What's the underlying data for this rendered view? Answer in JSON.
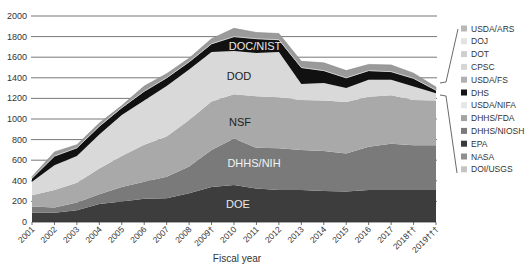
{
  "chart_data": {
    "type": "area",
    "stacked": true,
    "title": "",
    "xlabel": "Fiscal year",
    "ylabel": "",
    "ylim": [
      0,
      2000
    ],
    "yticks": [
      0,
      200,
      400,
      600,
      800,
      1000,
      1200,
      1400,
      1600,
      1800,
      2000
    ],
    "grid": true,
    "legend_position": "right",
    "categories": [
      "2001",
      "2002",
      "2003",
      "2004",
      "2005",
      "2006",
      "2007",
      "2008",
      "2009†",
      "2010",
      "2011",
      "2012",
      "2013",
      "2014",
      "2015",
      "2016",
      "2017",
      "2018††",
      "2019†††"
    ],
    "series": [
      {
        "name": "DOE",
        "color": "#3d3d3d",
        "label_color": "#e8e8e8",
        "values": [
          90,
          90,
          115,
          175,
          200,
          225,
          230,
          280,
          340,
          360,
          325,
          310,
          310,
          300,
          295,
          310,
          310,
          310,
          310
        ]
      },
      {
        "name": "DHHS/NIH",
        "color": "#7a7a7a",
        "label_color": "#f2f2f2",
        "values": [
          60,
          50,
          75,
          95,
          140,
          165,
          210,
          260,
          360,
          450,
          395,
          405,
          390,
          390,
          370,
          420,
          450,
          435,
          435
        ]
      },
      {
        "name": "NSF",
        "color": "#a9a9a9",
        "label_color": "#222222",
        "values": [
          110,
          170,
          190,
          250,
          300,
          360,
          390,
          450,
          470,
          430,
          500,
          495,
          485,
          490,
          500,
          485,
          470,
          440,
          435
        ]
      },
      {
        "name": "DOD",
        "color": "#d9d9d9",
        "label_color": "#222222",
        "values": [
          130,
          240,
          260,
          330,
          400,
          430,
          490,
          490,
          480,
          420,
          420,
          440,
          155,
          170,
          135,
          165,
          150,
          130,
          70
        ]
      },
      {
        "name": "DOC/NIST",
        "color": "#111111",
        "label_color": "#e8e8e8",
        "values": [
          35,
          90,
          80,
          80,
          70,
          90,
          80,
          75,
          80,
          140,
          140,
          120,
          160,
          120,
          100,
          90,
          80,
          80,
          30
        ]
      },
      {
        "name": "Other agencies",
        "color": "#9a9a9a",
        "label_color": "#222222",
        "values": [
          15,
          40,
          30,
          30,
          20,
          50,
          40,
          35,
          50,
          80,
          60,
          60,
          60,
          75,
          70,
          60,
          65,
          50,
          30
        ]
      }
    ],
    "area_labels": [
      {
        "series": "DOC/NIST",
        "text": "DOC/NIST"
      },
      {
        "series": "DOD",
        "text": "DOD"
      },
      {
        "series": "NSF",
        "text": "NSF"
      },
      {
        "series": "DHHS/NIH",
        "text": "DHHS/NIH"
      },
      {
        "series": "DOE",
        "text": "DOE"
      }
    ],
    "legend": [
      {
        "label": "USDA/ARS",
        "color": "#b8b8b8"
      },
      {
        "label": "DOJ",
        "color": "#e2e2e2"
      },
      {
        "label": "DOT",
        "color": "#cfcfcf"
      },
      {
        "label": "CPSC",
        "color": "#d6d6d6"
      },
      {
        "label": "USDA/FS",
        "color": "#b0b0b0"
      },
      {
        "label": "DHS",
        "color": "#151515"
      },
      {
        "label": "USDA/NIFA",
        "color": "#e6e6e6"
      },
      {
        "label": "DHHS/FDA",
        "color": "#a4a4a4"
      },
      {
        "label": "DHHS/NIOSH",
        "color": "#7a7a7a"
      },
      {
        "label": "EPA",
        "color": "#3a3a3a"
      },
      {
        "label": "NASA",
        "color": "#8f8f8f"
      },
      {
        "label": "DOI/USGS",
        "color": "#c4c4c4"
      }
    ]
  }
}
